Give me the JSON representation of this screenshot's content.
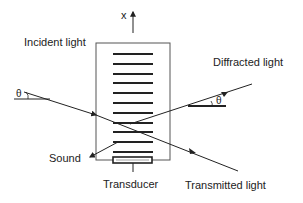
{
  "diagram": {
    "labels": {
      "x_axis": "x",
      "incident": "Incident light",
      "diffracted": "Diffracted light",
      "sound": "Sound",
      "transducer": "Transducer",
      "transmitted": "Transmitted light",
      "theta_left": "θ",
      "theta_right": "θ"
    },
    "colors": {
      "stroke": "#222222",
      "box": "#555555",
      "background": "#ffffff"
    },
    "stripe_count": 11
  }
}
